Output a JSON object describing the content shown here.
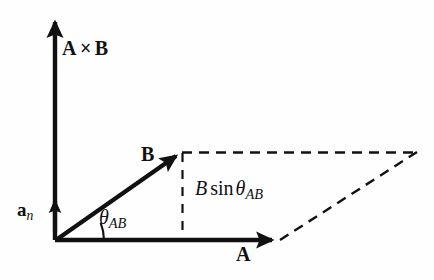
{
  "figure": {
    "background_color": "#fefefe",
    "ink_color": "#111111",
    "width": 434,
    "height": 280
  },
  "labels": {
    "cross_product": {
      "vector_a": "A",
      "times": "×",
      "vector_b": "B"
    },
    "unit_normal": {
      "base": "a",
      "subscript": "n"
    },
    "vector_b": "B",
    "vector_a": "A",
    "angle": {
      "symbol": "θ",
      "subscript": "AB"
    },
    "projection": {
      "magnitude": "B",
      "function": "sin",
      "angle_symbol": "θ",
      "angle_subscript": "AB"
    }
  },
  "geometry": {
    "origin": {
      "x": 56,
      "y": 240
    },
    "vector_a_tip": {
      "x": 278,
      "y": 240
    },
    "vector_b_tip": {
      "x": 181,
      "y": 152
    },
    "cross_axis_tip": {
      "x": 54,
      "y": 18
    },
    "normal_marker_tip": {
      "x": 55,
      "y": 197
    },
    "parallelogram_far_vertex": {
      "x": 416,
      "y": 152
    },
    "projection_foot": {
      "x": 182,
      "y": 240
    },
    "angle_arc_radius": 46,
    "angle_degrees": 21.6,
    "solid_stroke_width": 4,
    "dashed_stroke_width": 2,
    "dash_pattern": "9 7"
  }
}
